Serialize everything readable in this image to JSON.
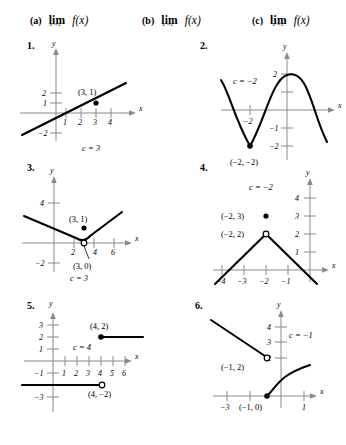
{
  "header": {
    "items": [
      {
        "tag": "(a)",
        "lim": "lim",
        "sub": "x→c⁺",
        "func": "f(x)"
      },
      {
        "tag": "(b)",
        "lim": "lim",
        "sub": "x→c⁻",
        "func": "f(x)"
      },
      {
        "tag": "(c)",
        "lim": "lim",
        "sub": "x→c",
        "func": "f(x)"
      }
    ]
  },
  "problems": [
    {
      "number": "1.",
      "axis_x_label": "x",
      "axis_y_label": "y",
      "x_ticks": [
        "1",
        "2",
        "3",
        "4"
      ],
      "y_ticks": [
        "2",
        "1",
        "−2"
      ],
      "point_labels": [
        "(3, 1)"
      ],
      "c_label": "c = 3",
      "graph_type": "line",
      "filled_points": [
        "(3, 1)"
      ],
      "open_points": []
    },
    {
      "number": "2.",
      "axis_x_label": "x",
      "axis_y_label": "y",
      "x_ticks": [
        "−2"
      ],
      "y_ticks": [
        "2",
        "−1",
        "−2"
      ],
      "point_labels": [
        "(−2, −2)"
      ],
      "c_label": "c = −2",
      "graph_type": "sinusoid",
      "filled_points": [
        "(−2, −2)"
      ],
      "open_points": []
    },
    {
      "number": "3.",
      "axis_x_label": "x",
      "axis_y_label": "y",
      "x_ticks": [
        "2",
        "4",
        "6"
      ],
      "y_ticks": [
        "4",
        "−2"
      ],
      "point_labels": [
        "(3, 1)",
        "(3, 0)"
      ],
      "c_label": "c = 3",
      "graph_type": "vee",
      "filled_points": [
        "(3, 1)"
      ],
      "open_points": [
        "(3, 0)"
      ]
    },
    {
      "number": "4.",
      "axis_x_label": "x",
      "axis_y_label": "y",
      "x_ticks": [
        "−4",
        "−3",
        "−2",
        "−1"
      ],
      "y_ticks": [
        "4",
        "3",
        "2",
        "1"
      ],
      "point_labels": [
        "(−2, 3)",
        "(−2, 2)"
      ],
      "c_label": "c = −2",
      "graph_type": "inverted-vee",
      "filled_points": [
        "(−2, 3)"
      ],
      "open_points": [
        "(−2, 2)"
      ]
    },
    {
      "number": "5.",
      "axis_x_label": "x",
      "axis_y_label": "y",
      "x_ticks": [
        "1",
        "2",
        "3",
        "4",
        "5",
        "6"
      ],
      "y_ticks": [
        "3",
        "2",
        "1",
        "−1",
        "−3"
      ],
      "point_labels": [
        "(4, 2)",
        "(4, −2)"
      ],
      "c_label": "c = 4",
      "graph_type": "step",
      "filled_points": [
        "(4, 2)"
      ],
      "open_points": [
        "(4, −2)"
      ]
    },
    {
      "number": "6.",
      "axis_x_label": "x",
      "axis_y_label": "y",
      "x_ticks": [
        "−3",
        "1"
      ],
      "y_ticks": [
        "4",
        "3",
        "2"
      ],
      "point_labels": [
        "(−1, 2)",
        "(−1, 0)"
      ],
      "c_label": "c = −1",
      "graph_type": "segment-and-root",
      "filled_points": [
        "(−1, 0)"
      ],
      "open_points": [
        "(−1, 2)"
      ]
    }
  ]
}
